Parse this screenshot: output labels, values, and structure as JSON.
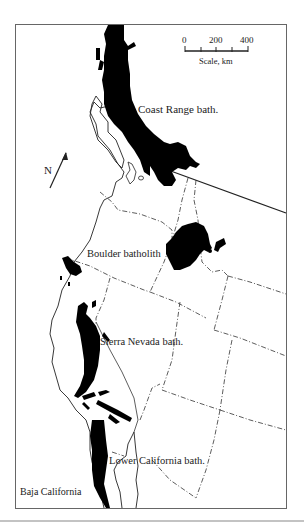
{
  "map": {
    "labels": {
      "coast_range": "Coast Range bath.",
      "boulder": "Boulder batholith",
      "sierra_nevada": "Sierra Nevada bath.",
      "lower_california": "Lower California bath.",
      "baja": "Baja California"
    },
    "north_arrow": {
      "label": "N",
      "icon": "north-arrow-icon"
    },
    "scale_bar": {
      "ticks": [
        "0",
        "200",
        "400"
      ],
      "caption": "Scale, km"
    },
    "colors": {
      "batholith_fill": "#000000",
      "outline": "#222222",
      "frame": "#555555",
      "background": "#ffffff"
    }
  }
}
